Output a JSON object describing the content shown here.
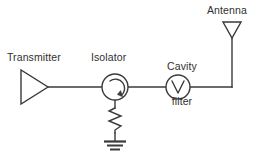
{
  "diagram": {
    "background_color": "#ffffff",
    "line_color": "#3a3a3a",
    "labels": {
      "transmitter": "Transmitter",
      "isolator": "Isolator",
      "cavity_filter_line1": "Cavity",
      "cavity_filter_line2": "filter",
      "antenna": "Antenna"
    },
    "components": [
      {
        "name": "transmitter",
        "symbol": "amplifier-triangle",
        "label": "Transmitter",
        "center_x": 34,
        "center_y": 87
      },
      {
        "name": "isolator",
        "symbol": "circle-with-circular-arrow",
        "label": "Isolator",
        "center_x": 115,
        "center_y": 87,
        "radius": 13
      },
      {
        "name": "cavity-filter",
        "symbol": "circle-with-v",
        "label": "Cavity filter",
        "center_x": 178,
        "center_y": 87,
        "radius": 12
      },
      {
        "name": "antenna",
        "symbol": "inverted-triangle-on-mast",
        "label": "Antenna",
        "center_x": 232,
        "center_y": 30
      },
      {
        "name": "termination-resistor",
        "symbol": "zigzag-resistor",
        "label": "",
        "center_x": 115,
        "center_y": 120
      },
      {
        "name": "ground",
        "symbol": "earth-ground",
        "label": "",
        "center_x": 115,
        "center_y": 145
      }
    ],
    "connections": [
      {
        "name": "transmitter-to-isolator",
        "from": "transmitter",
        "to": "isolator"
      },
      {
        "name": "isolator-to-cavity-filter",
        "from": "isolator",
        "to": "cavity-filter"
      },
      {
        "name": "cavity-filter-to-antenna",
        "from": "cavity-filter",
        "to": "antenna"
      },
      {
        "name": "isolator-to-resistor",
        "from": "isolator",
        "to": "termination-resistor"
      },
      {
        "name": "resistor-to-ground",
        "from": "termination-resistor",
        "to": "ground"
      }
    ]
  }
}
